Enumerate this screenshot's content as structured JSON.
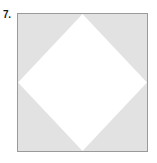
{
  "figure": {
    "problem_number": "7.",
    "caption": "",
    "outer_shape": {
      "name": "square",
      "fill_color": "#e2e2e2",
      "border_color": "#9a9a9a",
      "border_width_px": 1,
      "width_px": 131,
      "height_px": 139
    },
    "inner_shape": {
      "name": "diamond",
      "description": "rotated square with vertices at the midpoints of the outer square's sides",
      "fill_color": "#ffffff",
      "stroke_color": "none",
      "vertices": [
        {
          "label": "top",
          "x": 50,
          "y": 0
        },
        {
          "label": "right",
          "x": 100,
          "y": 50
        },
        {
          "label": "bottom",
          "x": 50,
          "y": 100
        },
        {
          "label": "left",
          "x": 0,
          "y": 50
        }
      ]
    },
    "background_color": "#ffffff"
  }
}
